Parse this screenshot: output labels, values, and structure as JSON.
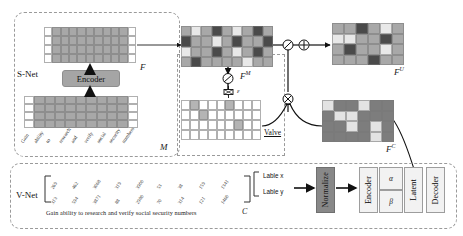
{
  "diagram": {
    "networks": {
      "snet_label": "S-Net",
      "vnet_label": "V-Net"
    },
    "modules": {
      "encoder_snet": "Encoder",
      "encoder_vnet": "Encoder",
      "normalize": "Normalize",
      "latent": "Latent",
      "decoder": "Decoder",
      "valve": "Valve"
    },
    "matrix_labels": {
      "feature": "F",
      "mask": "M",
      "masked_feature": "F",
      "masked_feature_sup": "M",
      "uncorrelated_feature": "F",
      "uncorrelated_feature_sup": "U",
      "correlated_feature": "F",
      "correlated_feature_sup": "C",
      "vnet_output": "C"
    },
    "operators": {
      "divide": "⊘",
      "add": "⊕",
      "multiply": "⊗",
      "noise": "ε",
      "alpha": "α",
      "beta": "β"
    },
    "labels": {
      "label_x": "Lable x",
      "label_y": "Lable y"
    },
    "tokens": [
      "Gain",
      "ability",
      "to",
      "research",
      "and",
      "verify",
      "social",
      "security",
      "numbers"
    ],
    "sentence": "Gain ability  to  research  and   verify   social security numbers",
    "values_row_top": [
      "269",
      "462",
      "3068",
      "319",
      "3900",
      "53",
      "38",
      "159",
      "1341"
    ],
    "values_row_bottom": [
      "313",
      "594",
      "3871",
      "88",
      "2980",
      "70",
      "314",
      "121",
      "1460"
    ],
    "colors": {
      "gray_fill": "#a8a8a8",
      "dark_fill": "#4a4a4a",
      "light_fill": "#e8e8e8",
      "mid_fill": "#7d7d7d",
      "line": "#1a1a1a",
      "dash": "#9a9a9a"
    },
    "feature_matrix_grid": {
      "rows": 4,
      "cols": 11
    },
    "mask_matrix_grid": {
      "rows": 4,
      "cols": 11
    },
    "fm_matrix_grid": {
      "rows": 4,
      "cols": 9
    },
    "sparse_matrix_grid": {
      "rows": 4,
      "cols": 9
    },
    "fu_matrix_grid": {
      "rows": 4,
      "cols": 6
    },
    "fc_matrix_grid": {
      "rows": 4,
      "cols": 6
    }
  }
}
